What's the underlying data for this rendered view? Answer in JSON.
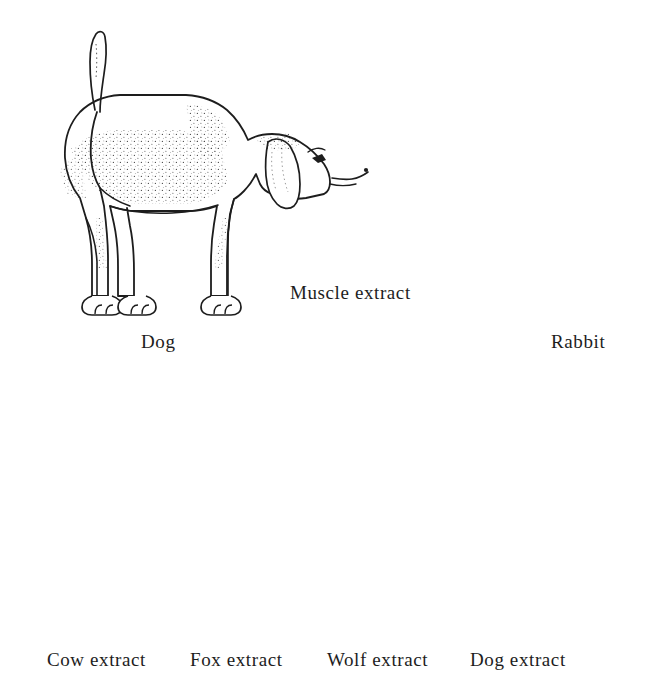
{
  "figure": {
    "title_visible": false,
    "background_color": "#ffffff",
    "ink_color": "#1d1d1d"
  },
  "animals": [
    {
      "id": "dog",
      "label": "Dog",
      "description": "line-art beagle standing in profile facing right with stipple shading",
      "label_x": 141,
      "label_y": 332
    },
    {
      "id": "rabbit",
      "label": "Rabbit",
      "description": "line-art rabbit sitting in profile facing right with hatch shading",
      "label_x": 551,
      "label_y": 332
    }
  ],
  "syringe": {
    "label": "Muscle extract",
    "description": "hypodermic syringe angled down-right injecting the rabbit",
    "label_x": 290,
    "label_y": 283
  },
  "arrows": {
    "origin_x": 490,
    "origin_y": 341,
    "count": 4,
    "targets": [
      210,
      345,
      415,
      500
    ]
  },
  "tubes": [
    {
      "id": "cow",
      "label": "Cow extract",
      "fill_color": "#ffffff",
      "fill_level": 0.62,
      "precipitate": "none",
      "center_x": 108,
      "label_x": 47
    },
    {
      "id": "fox",
      "label": "Fox extract",
      "fill_color": "#e6e6e6",
      "fill_level": 0.62,
      "precipitate": "slight",
      "center_x": 251,
      "label_x": 190
    },
    {
      "id": "wolf",
      "label": "Wolf extract",
      "fill_color": "#ababab",
      "fill_level": 0.62,
      "precipitate": "moderate",
      "center_x": 388,
      "label_x": 327
    },
    {
      "id": "dog",
      "label": "Dog extract",
      "fill_color": "#7b7b7b",
      "fill_level": 0.62,
      "precipitate": "heavy",
      "center_x": 531,
      "label_x": 470
    }
  ]
}
